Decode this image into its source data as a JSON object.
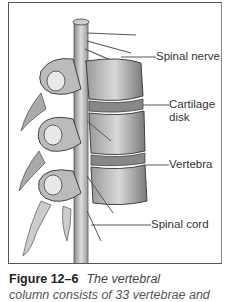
{
  "figure": {
    "labels": {
      "spinal_nerve": "Spinal nerve",
      "cartilage_disk_line1": "Cartilage",
      "cartilage_disk_line2": "disk",
      "vertebra": "Vertebra",
      "spinal_cord": "Spinal cord"
    },
    "illustration": "vertebral-column-illustration"
  },
  "caption": {
    "number": "Figure 12–6",
    "text": "The vertebral",
    "text_line2": "column consists of 33 vertebrae and"
  }
}
